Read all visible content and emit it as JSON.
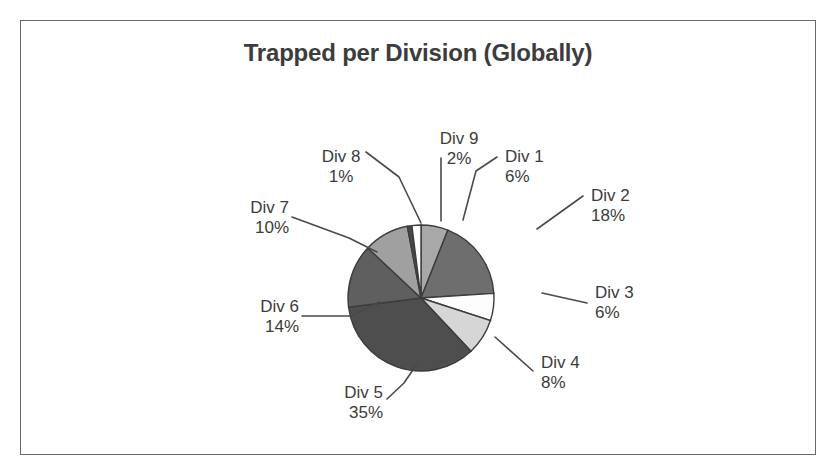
{
  "chart": {
    "title": "Trapped per Division (Globally)"
  },
  "chart_data": {
    "type": "pie",
    "title": "Trapped per Division (Globally)",
    "xlabel": "",
    "ylabel": "",
    "legend": "none",
    "grid": false,
    "value_suffix": "%",
    "categories": [
      "Div 1",
      "Div 2",
      "Div 3",
      "Div 4",
      "Div 5",
      "Div 6",
      "Div 7",
      "Div 8",
      "Div 9"
    ],
    "values": [
      6,
      18,
      6,
      8,
      35,
      14,
      10,
      1,
      2
    ],
    "labels": [
      "6%",
      "18%",
      "6%",
      "8%",
      "35%",
      "14%",
      "10%",
      "1%",
      "2%"
    ],
    "total": 100,
    "start_angle_deg": 0,
    "direction": "clockwise",
    "colors": [
      "#a8a8a8",
      "#6e6e6e",
      "#fdfdfd",
      "#d6d6d6",
      "#4e4e4e",
      "#5f5f5f",
      "#a0a0a0",
      "#4a4a4a",
      "#fdfdfd"
    ],
    "slice_outline_color": "#3c3c3c",
    "slices": [
      {
        "name": "Div 1",
        "percent": 6,
        "label": "6%",
        "color": "#a8a8a8"
      },
      {
        "name": "Div 2",
        "percent": 18,
        "label": "18%",
        "color": "#6e6e6e"
      },
      {
        "name": "Div 3",
        "percent": 6,
        "label": "6%",
        "color": "#fdfdfd"
      },
      {
        "name": "Div 4",
        "percent": 8,
        "label": "8%",
        "color": "#d6d6d6"
      },
      {
        "name": "Div 5",
        "percent": 35,
        "label": "35%",
        "color": "#4e4e4e"
      },
      {
        "name": "Div 6",
        "percent": 14,
        "label": "14%",
        "color": "#5f5f5f"
      },
      {
        "name": "Div 7",
        "percent": 10,
        "label": "10%",
        "color": "#a0a0a0"
      },
      {
        "name": "Div 8",
        "percent": 1,
        "label": "1%",
        "color": "#4a4a4a"
      },
      {
        "name": "Div 9",
        "percent": 2,
        "label": "2%",
        "color": "#fdfdfd"
      }
    ]
  },
  "labels": {
    "div1": {
      "name": "Div 1",
      "pct": "6%"
    },
    "div2": {
      "name": "Div 2",
      "pct": "18%"
    },
    "div3": {
      "name": "Div 3",
      "pct": "6%"
    },
    "div4": {
      "name": "Div 4",
      "pct": "8%"
    },
    "div5": {
      "name": "Div 5",
      "pct": "35%"
    },
    "div6": {
      "name": "Div 6",
      "pct": "14%"
    },
    "div7": {
      "name": "Div 7",
      "pct": "10%"
    },
    "div8": {
      "name": "Div 8",
      "pct": "1%"
    },
    "div9": {
      "name": "Div 9",
      "pct": "2%"
    }
  }
}
